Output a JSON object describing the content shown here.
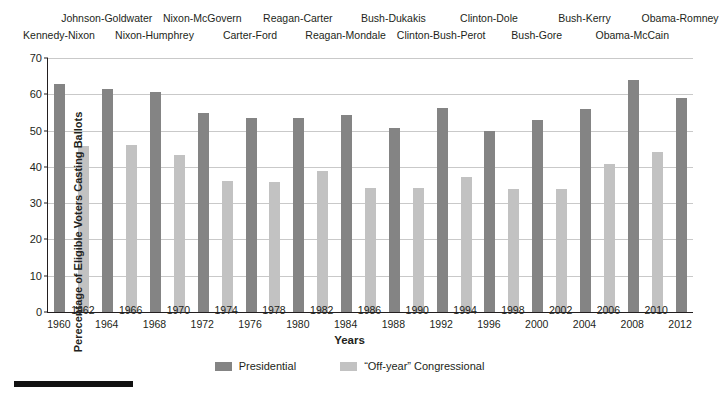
{
  "chart_data": {
    "type": "bar",
    "title": "",
    "xlabel": "Years",
    "ylabel": "Perecentage of Eligible Voters Casting Ballots",
    "ylim": [
      0,
      70
    ],
    "yticks": [
      0,
      10,
      20,
      30,
      40,
      50,
      60,
      70
    ],
    "grid": true,
    "legend_position": "bottom-center",
    "categories": [
      "1960",
      "1962",
      "1964",
      "1966",
      "1968",
      "1970",
      "1972",
      "1974",
      "1976",
      "1978",
      "1980",
      "1982",
      "1984",
      "1986",
      "1988",
      "1990",
      "1992",
      "1994",
      "1996",
      "1998",
      "2000",
      "2002",
      "2004",
      "2006",
      "2008",
      "2010",
      "2012"
    ],
    "series": [
      {
        "name": "Presidential",
        "color": "#848484",
        "points": [
          {
            "x": "1960",
            "y": 62.8
          },
          {
            "x": "1964",
            "y": 61.4
          },
          {
            "x": "1968",
            "y": 60.5
          },
          {
            "x": "1972",
            "y": 54.9
          },
          {
            "x": "1976",
            "y": 53.6
          },
          {
            "x": "1980",
            "y": 53.5
          },
          {
            "x": "1984",
            "y": 54.2
          },
          {
            "x": "1988",
            "y": 50.6
          },
          {
            "x": "1992",
            "y": 56.2
          },
          {
            "x": "1996",
            "y": 49.9
          },
          {
            "x": "2000",
            "y": 52.8
          },
          {
            "x": "2004",
            "y": 55.9
          },
          {
            "x": "2008",
            "y": 63.9
          },
          {
            "x": "2012",
            "y": 59.1
          }
        ]
      },
      {
        "name": "“Off-year” Congressional",
        "color": "#c2c2c2",
        "points": [
          {
            "x": "1962",
            "y": 45.8
          },
          {
            "x": "1966",
            "y": 45.9
          },
          {
            "x": "1970",
            "y": 43.3
          },
          {
            "x": "1974",
            "y": 36.1
          },
          {
            "x": "1978",
            "y": 35.7
          },
          {
            "x": "1982",
            "y": 38.8
          },
          {
            "x": "1986",
            "y": 34.3
          },
          {
            "x": "1990",
            "y": 34.1
          },
          {
            "x": "1994",
            "y": 37.2
          },
          {
            "x": "1998",
            "y": 33.8
          },
          {
            "x": "2002",
            "y": 34.0
          },
          {
            "x": "2006",
            "y": 40.8
          },
          {
            "x": "2010",
            "y": 44.0
          }
        ]
      }
    ],
    "annotations_top": [
      {
        "label": "Kennedy-Nixon",
        "row": "bottom",
        "anchor_year": "1960"
      },
      {
        "label": "Johnson-Goldwater",
        "row": "top",
        "anchor_year": "1964"
      },
      {
        "label": "Nixon-Humphrey",
        "row": "bottom",
        "anchor_year": "1968"
      },
      {
        "label": "Nixon-McGovern",
        "row": "top",
        "anchor_year": "1972"
      },
      {
        "label": "Carter-Ford",
        "row": "bottom",
        "anchor_year": "1976"
      },
      {
        "label": "Reagan-Carter",
        "row": "top",
        "anchor_year": "1980"
      },
      {
        "label": "Reagan-Mondale",
        "row": "bottom",
        "anchor_year": "1984"
      },
      {
        "label": "Bush-Dukakis",
        "row": "top",
        "anchor_year": "1988"
      },
      {
        "label": "Clinton-Bush-Perot",
        "row": "bottom",
        "anchor_year": "1992"
      },
      {
        "label": "Clinton-Dole",
        "row": "top",
        "anchor_year": "1996"
      },
      {
        "label": "Bush-Gore",
        "row": "bottom",
        "anchor_year": "2000"
      },
      {
        "label": "Bush-Kerry",
        "row": "top",
        "anchor_year": "2004"
      },
      {
        "label": "Obama-McCain",
        "row": "bottom",
        "anchor_year": "2008"
      },
      {
        "label": "Obama-Romney",
        "row": "top",
        "anchor_year": "2012"
      }
    ],
    "year_label_rows": {
      "upper": [
        "1962",
        "1966",
        "1970",
        "1974",
        "1978",
        "1982",
        "1986",
        "1990",
        "1994",
        "1998",
        "2002",
        "2006",
        "2010"
      ],
      "lower": [
        "1960",
        "1964",
        "1968",
        "1972",
        "1976",
        "1980",
        "1984",
        "1988",
        "1992",
        "1996",
        "2000",
        "2004",
        "2008",
        "2012"
      ]
    }
  },
  "legend": {
    "items": [
      {
        "label": "Presidential",
        "swatch": "pres"
      },
      {
        "label": "“Off-year” Congressional",
        "swatch": "offyear"
      }
    ]
  },
  "footer": {
    "rule_present": true
  }
}
